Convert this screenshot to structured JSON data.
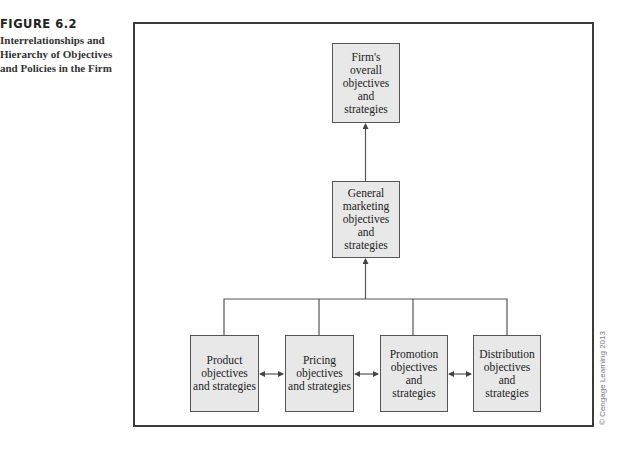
{
  "caption": {
    "figure_number": "FIGURE 6.2",
    "title": "Interrelationships and Hierarchy of Objectives and Policies in the Firm"
  },
  "diagram": {
    "nodes": {
      "firm": "Firm's overall objectives and strategies",
      "marketing": "General marketing objectives and strategies",
      "product": "Product objectives and strategies",
      "pricing": "Pricing objectives and strategies",
      "promotion": "Promotion objectives and strategies",
      "distribution": "Distribution objectives and strategies"
    },
    "edges": [
      {
        "from": "marketing",
        "to": "firm",
        "type": "arrow"
      },
      {
        "from": "product",
        "to": "marketing",
        "type": "arrow-merged"
      },
      {
        "from": "pricing",
        "to": "marketing",
        "type": "arrow-merged"
      },
      {
        "from": "promotion",
        "to": "marketing",
        "type": "arrow-merged"
      },
      {
        "from": "distribution",
        "to": "marketing",
        "type": "arrow-merged"
      },
      {
        "from": "product",
        "to": "pricing",
        "type": "bidirectional"
      },
      {
        "from": "pricing",
        "to": "promotion",
        "type": "bidirectional"
      },
      {
        "from": "promotion",
        "to": "distribution",
        "type": "bidirectional"
      }
    ],
    "colors": {
      "box_fill": "#e8e8e8",
      "box_border": "#555555",
      "line": "#555555",
      "frame": "#3a3a3a"
    }
  },
  "credit": "© Cengage Learning 2013"
}
